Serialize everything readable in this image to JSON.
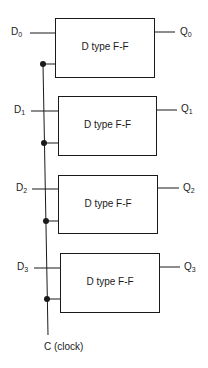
{
  "diagram": {
    "type": "parallel register of D type flip-flops",
    "flipflops": [
      {
        "label": "D type F-F",
        "input": {
          "base": "D",
          "sub": "0"
        },
        "output": {
          "base": "Q",
          "sub": "0"
        }
      },
      {
        "label": "D type F-F",
        "input": {
          "base": "D",
          "sub": "1"
        },
        "output": {
          "base": "Q",
          "sub": "1"
        }
      },
      {
        "label": "D type F-F",
        "input": {
          "base": "D",
          "sub": "2"
        },
        "output": {
          "base": "Q",
          "sub": "2"
        }
      },
      {
        "label": "D type F-F",
        "input": {
          "base": "D",
          "sub": "3"
        },
        "output": {
          "base": "Q",
          "sub": "3"
        }
      }
    ],
    "clock_label": "C (clock)",
    "colors": {
      "line": "#1a1a1a",
      "background": "#ffffff"
    }
  }
}
